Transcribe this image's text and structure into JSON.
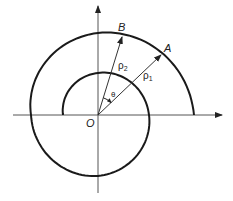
{
  "diagram": {
    "type": "spiral-polar-diagram",
    "origin_label": "O",
    "angle_label": "θ",
    "points": [
      {
        "label": "A",
        "radius_label": "ρ",
        "radius_subscript": "1"
      },
      {
        "label": "B",
        "radius_label": "ρ",
        "radius_subscript": "2"
      }
    ],
    "axes": {
      "x_arrow": true,
      "y_arrow": true
    },
    "colors": {
      "curve": "#1a1a1a",
      "axis": "#555555",
      "ray": "#333333"
    }
  }
}
